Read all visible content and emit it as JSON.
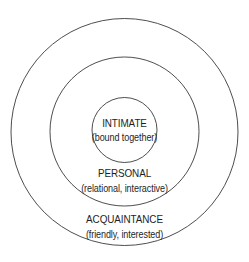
{
  "diagram": {
    "type": "concentric-circles",
    "stroke_color": "#3a3a3a",
    "rings": [
      {
        "title": "INTIMATE",
        "subtitle": "(bound together)"
      },
      {
        "title": "PERSONAL",
        "subtitle": "(relational, interactive)"
      },
      {
        "title": "ACQUAINTANCE",
        "subtitle": "(friendly, interested)"
      }
    ]
  }
}
